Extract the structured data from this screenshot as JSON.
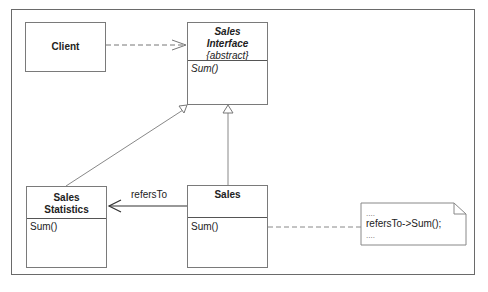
{
  "diagram": {
    "type": "UML class diagram",
    "classes": {
      "client": {
        "name": "Client"
      },
      "sales_interface": {
        "name_line1": "Sales",
        "name_line2": "Interface",
        "stereotype": "{abstract}",
        "operations": [
          "Sum()"
        ]
      },
      "sales_statistics": {
        "name_line1": "Sales",
        "name_line2": "Statistics",
        "operations": [
          "Sum()"
        ]
      },
      "sales": {
        "name": "Sales",
        "operations": [
          "Sum()"
        ]
      }
    },
    "relationships": [
      {
        "from": "Client",
        "to": "Sales Interface",
        "kind": "dependency"
      },
      {
        "from": "Sales Statistics",
        "to": "Sales Interface",
        "kind": "generalization"
      },
      {
        "from": "Sales",
        "to": "Sales Interface",
        "kind": "generalization"
      },
      {
        "from": "Sales",
        "to": "Sales Statistics",
        "kind": "association",
        "label": "refersTo"
      },
      {
        "from": "Sales.Sum()",
        "to": "note",
        "kind": "note-link"
      }
    ],
    "association_label": "refersTo",
    "note": {
      "line1": "....",
      "line2": "refersTo->Sum();",
      "line3": "...."
    },
    "colors": {
      "line": "#6a6a6a",
      "text": "#222222",
      "background": "#ffffff"
    }
  }
}
